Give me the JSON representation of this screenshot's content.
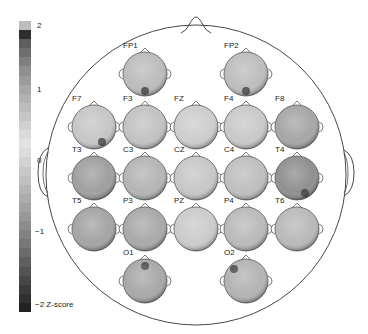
{
  "colorbar": {
    "ticks": [
      {
        "label": "2",
        "value": 2
      },
      {
        "label": "1",
        "value": 1
      },
      {
        "label": "0",
        "value": 0
      },
      {
        "label": "−1",
        "value": -1
      },
      {
        "label": "−2 Z-score",
        "value": -2
      }
    ],
    "unit": "Z-score",
    "range": [
      -2,
      2
    ],
    "segments": [
      "#bdbdbd",
      "#2f2f2f",
      "#5d5d5d",
      "#6e6e6e",
      "#7f7f7f",
      "#8f8f8f",
      "#9b9b9b",
      "#a7a7a7",
      "#b2b2b2",
      "#bcbcbc",
      "#c6c6c6",
      "#d0d0d0",
      "#dadada",
      "#e2e2e2",
      "#dcdcdc",
      "#d2d2d2",
      "#c8c8c8",
      "#bfbfbf",
      "#b5b5b5",
      "#acacac",
      "#a2a2a2",
      "#989898",
      "#8d8d8d",
      "#828282",
      "#777777",
      "#6b6b6b",
      "#5f5f5f",
      "#535353",
      "#474747",
      "#3b3b3b",
      "#2f2f2f",
      "#222222"
    ]
  },
  "scalp": {
    "outline_color": "#333333",
    "electrodes": [
      {
        "name": "FP1",
        "row": 0,
        "col": 1,
        "fill": "#bcbcbc",
        "dark_spot": "bottom"
      },
      {
        "name": "FP2",
        "row": 0,
        "col": 3,
        "fill": "#bdbdbd",
        "dark_spot": "bottom"
      },
      {
        "name": "F7",
        "row": 1,
        "col": 0,
        "fill": "#c6c6c6",
        "dark_spot": "bottom-right"
      },
      {
        "name": "F3",
        "row": 1,
        "col": 1,
        "fill": "#c2c2c2",
        "dark_spot": "none"
      },
      {
        "name": "FZ",
        "row": 1,
        "col": 2,
        "fill": "#cdcdcd",
        "dark_spot": "none"
      },
      {
        "name": "F4",
        "row": 1,
        "col": 3,
        "fill": "#c9c9c9",
        "dark_spot": "none"
      },
      {
        "name": "F8",
        "row": 1,
        "col": 4,
        "fill": "#a6a6a6",
        "dark_spot": "none"
      },
      {
        "name": "T3",
        "row": 2,
        "col": 0,
        "fill": "#9f9f9f",
        "dark_spot": "none"
      },
      {
        "name": "C3",
        "row": 2,
        "col": 1,
        "fill": "#b4b4b4",
        "dark_spot": "none"
      },
      {
        "name": "CZ",
        "row": 2,
        "col": 2,
        "fill": "#c7c7c7",
        "dark_spot": "none"
      },
      {
        "name": "C4",
        "row": 2,
        "col": 3,
        "fill": "#bebebe",
        "dark_spot": "none"
      },
      {
        "name": "T4",
        "row": 2,
        "col": 4,
        "fill": "#8f8f8f",
        "dark_spot": "bottom-right"
      },
      {
        "name": "T5",
        "row": 3,
        "col": 0,
        "fill": "#a4a4a4",
        "dark_spot": "none"
      },
      {
        "name": "P3",
        "row": 3,
        "col": 1,
        "fill": "#a9a9a9",
        "dark_spot": "none"
      },
      {
        "name": "PZ",
        "row": 3,
        "col": 2,
        "fill": "#cbcbcb",
        "dark_spot": "none"
      },
      {
        "name": "P4",
        "row": 3,
        "col": 3,
        "fill": "#bababa",
        "dark_spot": "none"
      },
      {
        "name": "T6",
        "row": 3,
        "col": 4,
        "fill": "#b9b9b9",
        "dark_spot": "none"
      },
      {
        "name": "O1",
        "row": 4,
        "col": 1,
        "fill": "#a8a8a8",
        "dark_spot": "top"
      },
      {
        "name": "O2",
        "row": 4,
        "col": 3,
        "fill": "#b3b3b3",
        "dark_spot": "top-left"
      }
    ]
  }
}
